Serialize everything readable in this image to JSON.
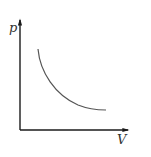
{
  "diagram": {
    "type": "p-V diagram",
    "y_axis_label": "p",
    "x_axis_label": "V",
    "curve": {
      "description": "hyperbolic decreasing curve (pressure vs volume, e.g. isotherm)",
      "start": [
        38,
        49
      ],
      "end": [
        106,
        110
      ]
    },
    "colors": {
      "axis": "#1a1a1a",
      "curve": "#555555",
      "label": "#333333",
      "background": "#ffffff"
    }
  }
}
